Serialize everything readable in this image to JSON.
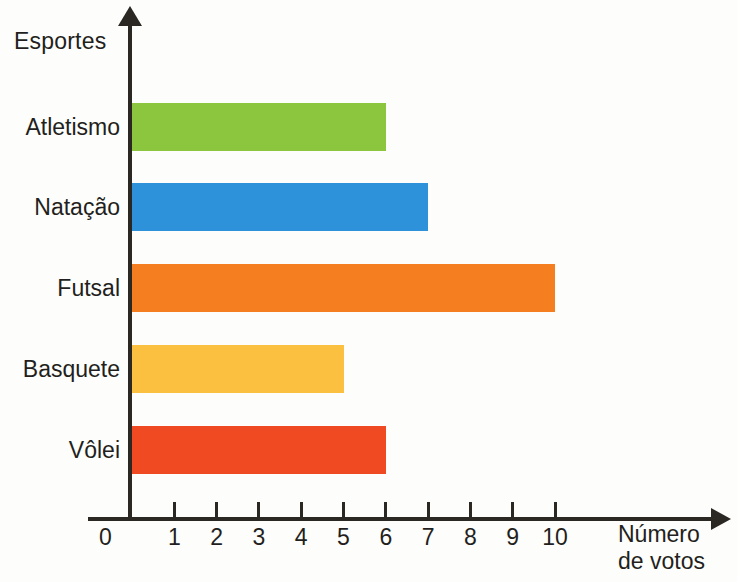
{
  "chart_data": {
    "type": "bar",
    "orientation": "horizontal",
    "title": "",
    "xlabel": "Número de votos",
    "xlabel_lines": [
      "Número",
      "de votos"
    ],
    "ylabel": "Esportes",
    "categories": [
      "Atletismo",
      "Natação",
      "Futsal",
      "Basquete",
      "Vôlei"
    ],
    "values": [
      6,
      7,
      10,
      5,
      6
    ],
    "xlim": [
      0,
      10
    ],
    "x_ticks": [
      0,
      1,
      2,
      3,
      4,
      5,
      6,
      7,
      8,
      9,
      10
    ],
    "x_tick_labels": [
      "0",
      "1",
      "2",
      "3",
      "4",
      "5",
      "6",
      "7",
      "8",
      "9",
      "10"
    ],
    "grid": false,
    "legend": false,
    "bar_colors": [
      "#8CC63E",
      "#2E92DB",
      "#F57E20",
      "#FBC040",
      "#F04A23"
    ],
    "axis_color": "#2B2723",
    "background": "#FDFDFB",
    "bars": [
      {
        "label": "Atletismo",
        "value": 6,
        "color": "#8CC63E"
      },
      {
        "label": "Natação",
        "value": 7,
        "color": "#2E92DB"
      },
      {
        "label": "Futsal",
        "value": 10,
        "color": "#F57E20"
      },
      {
        "label": "Basquete",
        "value": 5,
        "color": "#FBC040"
      },
      {
        "label": "Vôlei",
        "value": 6,
        "color": "#F04A23"
      }
    ]
  }
}
